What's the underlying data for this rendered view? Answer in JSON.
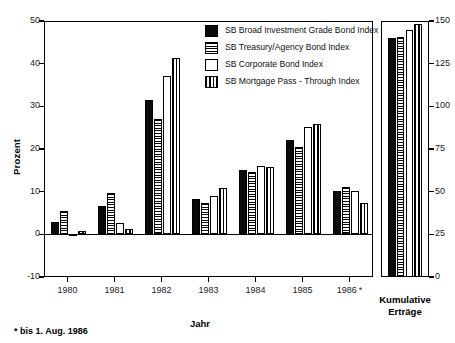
{
  "chart_data": {
    "type": "bar",
    "title": "",
    "xlabel": "Jahr",
    "ylabel": "Prozent",
    "categories": [
      "1980",
      "1981",
      "1982",
      "1983",
      "1984",
      "1985",
      "1986*"
    ],
    "series": [
      {
        "name": "SB Broad Investment Grade Bond Index",
        "pattern": "solid",
        "values": [
          2.8,
          6.6,
          31.4,
          8.3,
          15.0,
          22.2,
          10.2
        ],
        "cumulative": 140.0
      },
      {
        "name": "SB Treasury/Agency Bond Index",
        "pattern": "horizontal-lines",
        "values": [
          5.5,
          9.8,
          27.0,
          7.4,
          14.5,
          20.5,
          11.2
        ],
        "cumulative": 140.5
      },
      {
        "name": "SB Corporate Bond Index",
        "pattern": "open",
        "values": [
          -0.5,
          2.7,
          37.0,
          9.0,
          16.0,
          25.2,
          10.2
        ],
        "cumulative": 145.0
      },
      {
        "name": "SB Mortgage Pass - Through Index",
        "pattern": "vertical-lines",
        "values": [
          0.7,
          1.3,
          41.4,
          10.8,
          15.7,
          25.8,
          7.3
        ],
        "cumulative": 148.0
      }
    ],
    "ylim": [
      -10,
      50
    ],
    "yticks": [
      "-10",
      "0",
      "10",
      "20",
      "30",
      "40",
      "50"
    ],
    "ylim_right": [
      0,
      150
    ],
    "yticks_right": [
      "0",
      "25",
      "50",
      "75",
      "100",
      "125",
      "150"
    ],
    "grid": false,
    "legend_position": "top-right"
  },
  "axes": {
    "left_title": "Prozent",
    "bottom_title": "Jahr",
    "left_ticks": [
      "50",
      "40",
      "30",
      "20",
      "10",
      "0",
      "-10"
    ],
    "right_ticks": [
      "150",
      "125",
      "100",
      "75",
      "50",
      "25",
      "0"
    ]
  },
  "legend": {
    "items": [
      {
        "label": "SB Broad Investment Grade Bond Index",
        "swatch": "solid-swatch"
      },
      {
        "label": "SB Treasury/Agency Bond Index",
        "swatch": "horizontal-lines-swatch"
      },
      {
        "label": "SB Corporate Bond Index",
        "swatch": "open-swatch"
      },
      {
        "label": "SB Mortgage Pass - Through Index",
        "swatch": "vertical-lines-swatch"
      }
    ]
  },
  "xlabels": [
    "1980",
    "1981",
    "1982",
    "1983",
    "1984",
    "1985",
    "1986"
  ],
  "x1986_marker": "*",
  "cumulative_panel": {
    "line1": "Kumulative",
    "line2": "Erträge"
  },
  "footnote": {
    "marker": "*",
    "text": "bis 1. Aug. 1986"
  }
}
